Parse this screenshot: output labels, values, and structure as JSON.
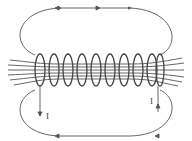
{
  "diagram": {
    "labels": {
      "current_left": "I",
      "current_right": "I"
    },
    "colors": {
      "line": "#555555",
      "background": "#ffffff"
    },
    "coil_turns": 10
  }
}
